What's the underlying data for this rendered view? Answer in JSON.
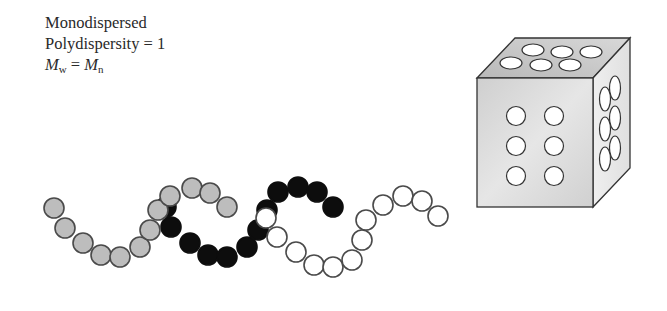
{
  "labels": {
    "line1": "Monodispersed",
    "line2": "Polydispersity = 1",
    "line3": {
      "mw_symbol": "M",
      "mw_sub": "w",
      "equals": " = ",
      "mn_symbol": "M",
      "mn_sub": "n"
    }
  },
  "diagram": {
    "bead_radius": 10,
    "chains": [
      {
        "name": "gray-chain",
        "fill": "#bdbdbd",
        "stroke": "#4a4a4a",
        "beads": [
          [
            54,
            208
          ],
          [
            65,
            228
          ],
          [
            83,
            243
          ],
          [
            101,
            255
          ],
          [
            120,
            257
          ],
          [
            140,
            247
          ],
          [
            150,
            230
          ],
          [
            158,
            210
          ],
          [
            170,
            196
          ],
          [
            192,
            188
          ],
          [
            210,
            193
          ],
          [
            227,
            207
          ]
        ]
      },
      {
        "name": "black-chain",
        "fill": "#0d0d0d",
        "stroke": "#0d0d0d",
        "beads": [
          [
            166,
            207
          ],
          [
            171,
            227
          ],
          [
            190,
            243
          ],
          [
            208,
            255
          ],
          [
            227,
            257
          ],
          [
            247,
            247
          ],
          [
            258,
            230
          ],
          [
            267,
            210
          ],
          [
            278,
            192
          ],
          [
            298,
            187
          ],
          [
            317,
            192
          ],
          [
            333,
            207
          ]
        ]
      },
      {
        "name": "white-chain",
        "fill": "#ffffff",
        "stroke": "#4a4a4a",
        "beads": [
          [
            266,
            218
          ],
          [
            277,
            237
          ],
          [
            296,
            252
          ],
          [
            314,
            265
          ],
          [
            333,
            267
          ],
          [
            352,
            260
          ],
          [
            362,
            240
          ],
          [
            366,
            220
          ],
          [
            383,
            205
          ],
          [
            403,
            196
          ],
          [
            422,
            201
          ],
          [
            438,
            216
          ]
        ]
      }
    ],
    "cube": {
      "face_fill_front": "#d9d9d9",
      "face_fill_top": "#c8c8c8",
      "face_fill_right": "#e4e4e4",
      "stroke": "#333333",
      "front_holes": 6,
      "top_holes": 6,
      "right_holes": 6
    }
  }
}
